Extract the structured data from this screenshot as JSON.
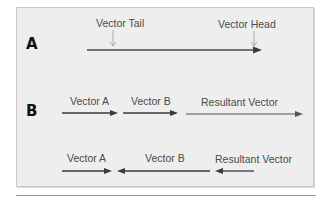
{
  "diagram": {
    "colors": {
      "panel_bg": "#eeeeee",
      "arrow": "#3a3a3a",
      "pointer": "#999999",
      "text": "#4a4a4a"
    },
    "section_a": {
      "letter": "A",
      "tail_label": "Vector Tail",
      "head_label": "Vector Head"
    },
    "section_b": {
      "letter": "B",
      "row1": {
        "vector_a_label": "Vector A",
        "vector_b_label": "Vector B",
        "resultant_label": "Resultant Vector"
      },
      "row2": {
        "vector_a_label": "Vector A",
        "vector_b_label": "Vector B",
        "resultant_label": "Resultant Vector"
      }
    }
  }
}
